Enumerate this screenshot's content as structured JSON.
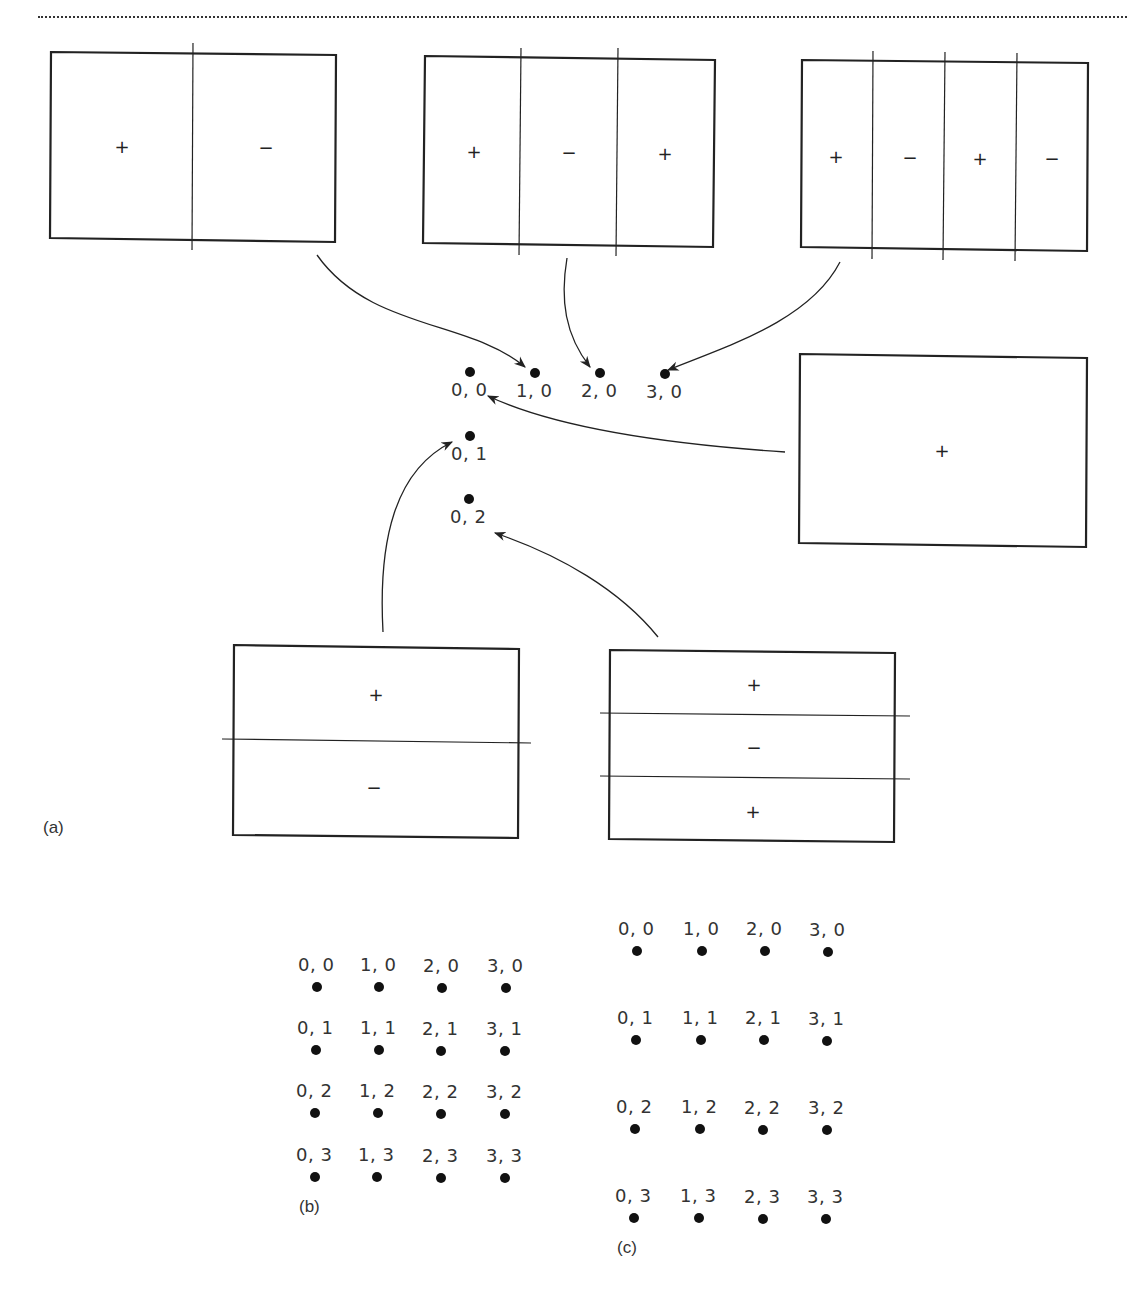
{
  "figure": {
    "part_labels": {
      "a": "(a)",
      "b": "(b)",
      "c": "(c)"
    },
    "colors": {
      "line": "#222222",
      "dot": "#111111",
      "text": "#333333",
      "background": "#ffffff"
    }
  },
  "panel_a": {
    "center_points": [
      {
        "label": "0, 0"
      },
      {
        "label": "1, 0"
      },
      {
        "label": "2, 0"
      },
      {
        "label": "3, 0"
      },
      {
        "label": "0, 1"
      },
      {
        "label": "0, 2"
      }
    ],
    "modes": [
      {
        "name": "mode-1-0",
        "signs": [
          "+",
          "−"
        ],
        "target": "1, 0"
      },
      {
        "name": "mode-2-0",
        "signs": [
          "+",
          "−",
          "+"
        ],
        "target": "2, 0"
      },
      {
        "name": "mode-3-0",
        "signs": [
          "+",
          "−",
          "+",
          "−"
        ],
        "target": "3, 0"
      },
      {
        "name": "mode-0-0",
        "signs": [
          "+"
        ],
        "target": "0, 0"
      },
      {
        "name": "mode-0-1",
        "signs": [
          "+",
          "−"
        ],
        "target": "0, 1"
      },
      {
        "name": "mode-0-2",
        "signs": [
          "+",
          "−",
          "+"
        ],
        "target": "0, 2"
      }
    ]
  },
  "panel_b": {
    "grid": [
      [
        "0, 0",
        "1, 0",
        "2, 0",
        "3, 0"
      ],
      [
        "0, 1",
        "1, 1",
        "2, 1",
        "3, 1"
      ],
      [
        "0, 2",
        "1, 2",
        "2, 2",
        "3, 2"
      ],
      [
        "0, 3",
        "1, 3",
        "2, 3",
        "3, 3"
      ]
    ]
  },
  "panel_c": {
    "grid": [
      [
        "0, 0",
        "1, 0",
        "2, 0",
        "3, 0"
      ],
      [
        "0, 1",
        "1, 1",
        "2, 1",
        "3, 1"
      ],
      [
        "0, 2",
        "1, 2",
        "2, 2",
        "3, 2"
      ],
      [
        "0, 3",
        "1, 3",
        "2, 3",
        "3, 3"
      ]
    ]
  }
}
